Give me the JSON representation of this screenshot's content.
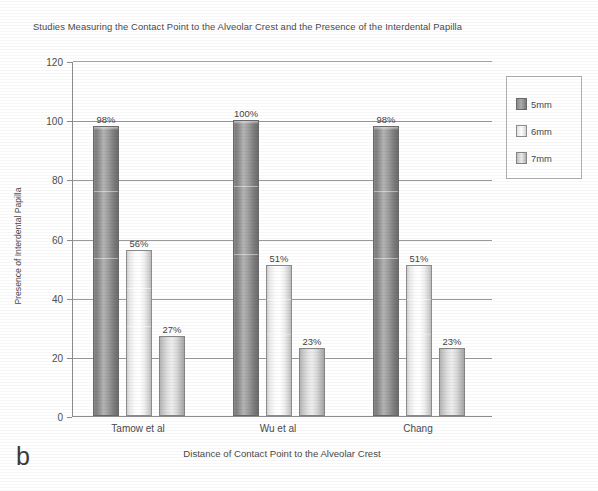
{
  "panel_letter": "b",
  "chart_data": {
    "type": "bar",
    "title": "Studies Measuring the Contact Point to the Alveolar Crest and the Presence of the Interdental Papilla",
    "xlabel": "Distance of Contact Point to the Alveolar Crest",
    "ylabel": "Presence of Interdental Papilla",
    "categories": [
      "Tamow et al",
      "Wu et al",
      "Chang"
    ],
    "series": [
      {
        "name": "5mm",
        "color": "#8f8f8f",
        "values": [
          98,
          100,
          98
        ],
        "labels": [
          "98%",
          "100%",
          "98%"
        ]
      },
      {
        "name": "6mm",
        "color": "#ffffff",
        "values": [
          56,
          51,
          51
        ],
        "labels": [
          "56%",
          "51%",
          "51%"
        ]
      },
      {
        "name": "7mm",
        "color": "#d8d8d8",
        "values": [
          27,
          23,
          23
        ],
        "labels": [
          "27%",
          "23%",
          "23%"
        ]
      }
    ],
    "ylim": [
      0,
      120
    ],
    "yticks": [
      0,
      20,
      40,
      60,
      80,
      100,
      120
    ],
    "ytick_labels": [
      "0",
      "20",
      "40",
      "60",
      "80",
      "100",
      "120"
    ],
    "grid": true,
    "legend_position": "right",
    "legend_entries": [
      "5mm",
      "6mm",
      "7mm"
    ]
  }
}
